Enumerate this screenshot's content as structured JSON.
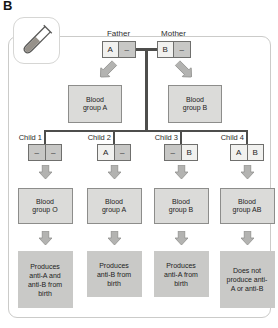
{
  "figure_label": "B",
  "icon": {
    "name": "test-tube-icon"
  },
  "colors": {
    "connector_line": "#4e4e4c",
    "arrow_fill": "#b3b3b1",
    "arrow_stroke": "#90908e",
    "allele_letter_bg": "#f1f1ef",
    "allele_dash_bg": "#c7c7c5",
    "group_box_bg": "#dbdbd9",
    "group_box_border": "#8d8d8b",
    "desc_box_bg": "#c9c9c7",
    "panel_border": "#cbcbc9"
  },
  "parents": [
    {
      "label": "Father",
      "alleles": [
        "A",
        "–"
      ],
      "blood_group": "Blood group A"
    },
    {
      "label": "Mother",
      "alleles": [
        "B",
        "–"
      ],
      "blood_group": "Blood group B"
    }
  ],
  "children": [
    {
      "label": "Child 1",
      "alleles": [
        "–",
        "–"
      ],
      "blood_group": "Blood group O",
      "antibodies": "Produces anti-A and anti-B from birth"
    },
    {
      "label": "Child 2",
      "alleles": [
        "A",
        "–"
      ],
      "blood_group": "Blood group A",
      "antibodies": "Produces anti-B from birth"
    },
    {
      "label": "Child 3",
      "alleles": [
        "–",
        "B"
      ],
      "blood_group": "Blood group B",
      "antibodies": "Produces anti-A from birth"
    },
    {
      "label": "Child 4",
      "alleles": [
        "A",
        "B"
      ],
      "blood_group": "Blood group AB",
      "antibodies": "Does not produce anti-A or anti-B"
    }
  ]
}
